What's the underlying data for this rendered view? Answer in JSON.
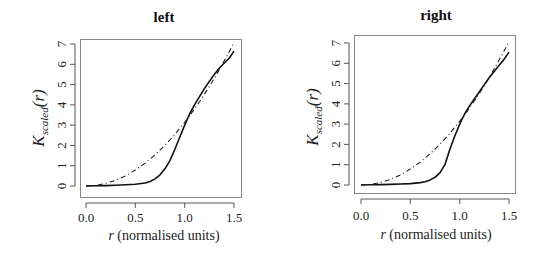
{
  "chart_data": [
    {
      "type": "line",
      "title": "left",
      "xlabel": "r (normalised units)",
      "ylabel": "K_scaled(r)",
      "xlim": [
        0,
        1.5
      ],
      "ylim": [
        0,
        7
      ],
      "xticks": [
        "0.0",
        "0.5",
        "1.0",
        "1.5"
      ],
      "yticks": [
        "0",
        "1",
        "2",
        "3",
        "4",
        "5",
        "6",
        "7"
      ],
      "grid": false,
      "legend": null,
      "x": [
        0.0,
        0.1,
        0.2,
        0.3,
        0.4,
        0.5,
        0.6,
        0.65,
        0.7,
        0.75,
        0.8,
        0.85,
        0.9,
        0.95,
        1.0,
        1.05,
        1.1,
        1.15,
        1.2,
        1.25,
        1.3,
        1.35,
        1.4,
        1.45,
        1.5
      ],
      "series": [
        {
          "name": "empirical",
          "style": "solid",
          "values": [
            0.0,
            0.01,
            0.02,
            0.04,
            0.06,
            0.09,
            0.15,
            0.22,
            0.35,
            0.55,
            0.85,
            1.25,
            1.8,
            2.4,
            3.0,
            3.55,
            4.0,
            4.4,
            4.8,
            5.15,
            5.5,
            5.8,
            6.05,
            6.3,
            6.65
          ]
        },
        {
          "name": "theoretical (pi r^2)",
          "style": "dashdot",
          "values": [
            0.0,
            0.03,
            0.13,
            0.28,
            0.5,
            0.79,
            1.13,
            1.33,
            1.54,
            1.77,
            2.01,
            2.27,
            2.54,
            2.84,
            3.14,
            3.46,
            3.8,
            4.15,
            4.52,
            4.91,
            5.31,
            5.73,
            6.16,
            6.61,
            7.07
          ]
        }
      ]
    },
    {
      "type": "line",
      "title": "right",
      "xlabel": "r (normalised units)",
      "ylabel": "K_scaled(r)",
      "xlim": [
        0,
        1.5
      ],
      "ylim": [
        0,
        7
      ],
      "xticks": [
        "0.0",
        "0.5",
        "1.0",
        "1.5"
      ],
      "yticks": [
        "0",
        "1",
        "2",
        "3",
        "4",
        "5",
        "6",
        "7"
      ],
      "grid": false,
      "legend": null,
      "x": [
        0.0,
        0.1,
        0.2,
        0.3,
        0.4,
        0.5,
        0.6,
        0.65,
        0.7,
        0.75,
        0.8,
        0.85,
        0.9,
        0.95,
        1.0,
        1.05,
        1.1,
        1.15,
        1.2,
        1.25,
        1.3,
        1.35,
        1.4,
        1.45,
        1.5
      ],
      "series": [
        {
          "name": "empirical",
          "style": "solid",
          "values": [
            0.0,
            0.01,
            0.02,
            0.03,
            0.05,
            0.07,
            0.12,
            0.16,
            0.25,
            0.38,
            0.6,
            1.0,
            1.75,
            2.4,
            3.0,
            3.5,
            3.9,
            4.25,
            4.6,
            4.95,
            5.3,
            5.6,
            5.9,
            6.2,
            6.55
          ]
        },
        {
          "name": "theoretical (pi r^2)",
          "style": "dashdot",
          "values": [
            0.0,
            0.03,
            0.13,
            0.28,
            0.5,
            0.79,
            1.13,
            1.33,
            1.54,
            1.77,
            2.01,
            2.27,
            2.54,
            2.84,
            3.14,
            3.46,
            3.8,
            4.15,
            4.52,
            4.91,
            5.31,
            5.73,
            6.16,
            6.61,
            7.07
          ]
        }
      ]
    }
  ],
  "panels": [
    {
      "title": "left",
      "xlabel_var": "r",
      "xlabel_rest": " (normalised units)",
      "ylabel_main": "K",
      "ylabel_sub": "scaled",
      "ylabel_tail": "(r)",
      "xticks": [
        "0.0",
        "0.5",
        "1.0",
        "1.5"
      ],
      "yticks": [
        "0",
        "1",
        "2",
        "3",
        "4",
        "5",
        "6",
        "7"
      ]
    },
    {
      "title": "right",
      "xlabel_var": "r",
      "xlabel_rest": " (normalised units)",
      "ylabel_main": "K",
      "ylabel_sub": "scaled",
      "ylabel_tail": "(r)",
      "xticks": [
        "0.0",
        "0.5",
        "1.0",
        "1.5"
      ],
      "yticks": [
        "0",
        "1",
        "2",
        "3",
        "4",
        "5",
        "6",
        "7"
      ]
    }
  ]
}
